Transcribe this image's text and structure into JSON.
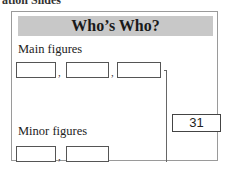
{
  "page": {
    "clipped_heading": "ation Slides"
  },
  "card": {
    "title": "Who’s Who?",
    "main_label": "Main figures",
    "minor_label": "Minor figures",
    "main_inputs": [
      "",
      "",
      ""
    ],
    "minor_inputs": [
      "",
      ""
    ],
    "separator": ",",
    "result": "31"
  }
}
